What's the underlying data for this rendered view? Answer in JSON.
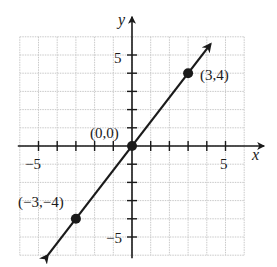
{
  "chart_data": {
    "type": "line",
    "title": "",
    "xlabel": "x",
    "ylabel": "y",
    "xlim": [
      -6,
      6
    ],
    "ylim": [
      -6,
      6
    ],
    "grid": true,
    "x_ticks_labeled": [
      -5,
      5
    ],
    "y_ticks_labeled": [
      5,
      -5
    ],
    "tick_labels": {
      "x_neg": "−5",
      "x_pos": "5",
      "y_pos": "5",
      "y_neg": "−5"
    },
    "series": [
      {
        "name": "y = 4/3 x",
        "x": [
          -4.5,
          4.2
        ],
        "y": [
          -6,
          5.6
        ],
        "arrows": "both"
      }
    ],
    "points": [
      {
        "x": -3,
        "y": -4,
        "label": "(−3,−4)"
      },
      {
        "x": 0,
        "y": 0,
        "label": "(0,0)"
      },
      {
        "x": 3,
        "y": 4,
        "label": "(3,4)"
      }
    ]
  },
  "colors": {
    "grid": "#c9c9c9",
    "ink": "#1a1a1a",
    "background": "#ffffff"
  }
}
